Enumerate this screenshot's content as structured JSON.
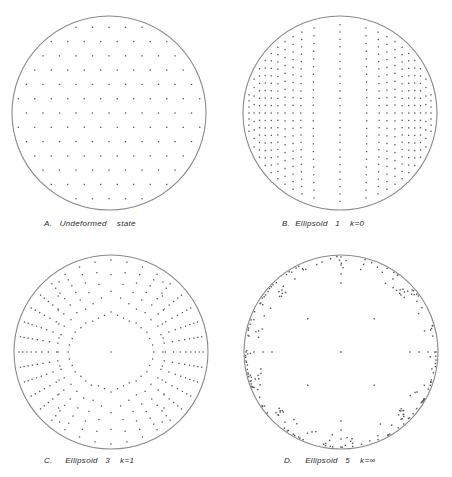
{
  "figure": {
    "background": "#ffffff",
    "stroke_color": "#8a8a8a",
    "dot_color": "#555555"
  },
  "panels": [
    {
      "id": "A",
      "label": "A.   Undeformed    state",
      "label_pos": [
        44,
        219
      ],
      "circle": {
        "cx": 109,
        "cy": 113,
        "r": 97
      },
      "pattern": "uniform",
      "description": "Uniform hexagonal-like distribution of points over whole projection"
    },
    {
      "id": "B",
      "label": "B.  Ellipsoid   1    k=0",
      "label_pos": [
        282,
        219
      ],
      "circle": {
        "cx": 340,
        "cy": 113,
        "r": 97
      },
      "pattern": "k0",
      "description": "Points arranged in vertical arcs, clustering toward left and right edges"
    },
    {
      "id": "C",
      "label": "C.     Ellipsoid   3    k=1",
      "label_pos": [
        44,
        456
      ],
      "circle": {
        "cx": 111,
        "cy": 352,
        "r": 97
      },
      "pattern": "k1",
      "description": "Points arranged in radial arcs, denser toward periphery on left and right"
    },
    {
      "id": "D",
      "label": "D.     Ellipsoid   5    k=∞",
      "label_pos": [
        284,
        456
      ],
      "circle": {
        "cx": 341,
        "cy": 352,
        "r": 97
      },
      "pattern": "kinf",
      "description": "Points concentrated on circumference with sparse radial spokes and a center point"
    }
  ]
}
